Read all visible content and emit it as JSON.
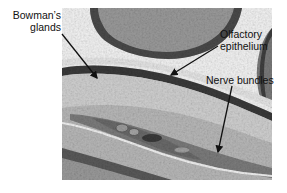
{
  "figure": {
    "type": "histology micrograph",
    "labels": [
      {
        "id": "bowmans",
        "line1": "Bowman’s",
        "line2": "glands"
      },
      {
        "id": "olfactory",
        "line1": "Olfactory",
        "line2": "epithelium"
      },
      {
        "id": "nerve",
        "line1": "Nerve bundles"
      }
    ],
    "colors": {
      "background": "#ffffff",
      "tissue_dark": "#3a3a3a",
      "tissue_mid": "#8a8a8a",
      "tissue_light": "#d8d8d8",
      "lumen": "#f4f4f4",
      "label_text": "#111111"
    }
  }
}
